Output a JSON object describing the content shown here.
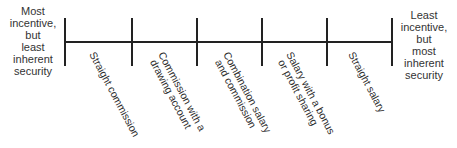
{
  "diagram": {
    "left_end": {
      "lines": [
        "Most",
        "incentive,",
        "but",
        "least",
        "inherent",
        "security"
      ]
    },
    "right_end": {
      "lines": [
        "Least",
        "incentive,",
        "but",
        "most",
        "inherent",
        "security"
      ]
    },
    "plans": [
      {
        "lines": [
          "Straight  commission"
        ]
      },
      {
        "lines": [
          "Commission with a",
          "drawing account"
        ]
      },
      {
        "lines": [
          "Combination salary",
          "and commission"
        ]
      },
      {
        "lines": [
          "Salary with a bonus",
          "or profit sharing"
        ]
      },
      {
        "lines": [
          "Straight  salary"
        ]
      }
    ],
    "line_color": "#222222"
  }
}
